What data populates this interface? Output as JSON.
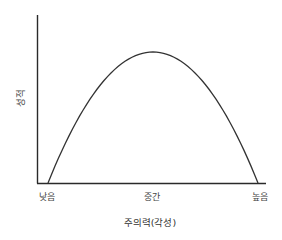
{
  "chart_data": {
    "type": "line",
    "title": "",
    "xlabel": "주의력(각성)",
    "ylabel": "성적",
    "x_ticks": [
      "낮음",
      "중간",
      "높음"
    ],
    "x": [
      0,
      0.1,
      0.2,
      0.3,
      0.4,
      0.5,
      0.6,
      0.7,
      0.8,
      0.9,
      1.0
    ],
    "series": [
      {
        "name": "성적",
        "values": [
          0,
          0.36,
          0.64,
          0.84,
          0.96,
          1.0,
          0.96,
          0.84,
          0.64,
          0.36,
          0
        ]
      }
    ],
    "shape": "inverted-U (Yerkes-Dodson curve)",
    "grid": false,
    "legend": "none",
    "axis_ranges": {
      "x": [
        0,
        1
      ],
      "y": [
        0,
        1
      ]
    },
    "line_color": "#333333"
  },
  "labels": {
    "x_tick_low": "낮음",
    "x_tick_mid": "중간",
    "x_tick_high": "높음",
    "x_title": "주의력(각성)",
    "y_title": "성적"
  }
}
